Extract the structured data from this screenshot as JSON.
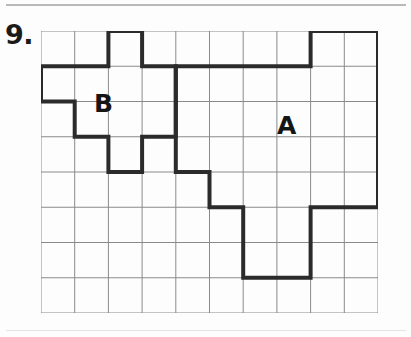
{
  "page": {
    "problem_number": "9.",
    "background_color": "#fdfdfd",
    "width": 411,
    "height": 337
  },
  "grid": {
    "columns": 10,
    "rows": 8,
    "cell_width": 33.7,
    "cell_height": 35.25,
    "origin_x": 41,
    "origin_y": 31,
    "line_color": "#8a8a8a",
    "line_width": 1
  },
  "shapes": [
    {
      "label": "A",
      "stroke_color": "#2b2b2b",
      "stroke_width": 4,
      "label_x": 277,
      "label_y": 113,
      "cells": [
        [
          8,
          0
        ],
        [
          9,
          0
        ],
        [
          5,
          1
        ],
        [
          6,
          1
        ],
        [
          7,
          1
        ],
        [
          8,
          1
        ],
        [
          9,
          1
        ],
        [
          5,
          2
        ],
        [
          6,
          2
        ],
        [
          7,
          2
        ],
        [
          8,
          2
        ],
        [
          9,
          2
        ],
        [
          5,
          3
        ],
        [
          6,
          3
        ],
        [
          7,
          3
        ],
        [
          8,
          3
        ],
        [
          9,
          3
        ],
        [
          5,
          4
        ],
        [
          6,
          4
        ],
        [
          7,
          4
        ],
        [
          8,
          4
        ],
        [
          5,
          5
        ],
        [
          6,
          5
        ],
        [
          7,
          5
        ],
        [
          8,
          5
        ],
        [
          7,
          6
        ],
        [
          8,
          6
        ]
      ],
      "outline_points": [
        [
          8,
          0
        ],
        [
          10,
          0
        ],
        [
          10,
          5
        ],
        [
          8,
          5
        ],
        [
          8,
          7
        ],
        [
          6,
          7
        ],
        [
          6,
          5
        ],
        [
          5,
          5
        ],
        [
          5,
          4
        ],
        [
          4,
          4
        ],
        [
          4,
          1
        ],
        [
          8,
          1
        ]
      ]
    },
    {
      "label": "B",
      "stroke_color": "#2b2b2b",
      "stroke_width": 4,
      "label_x": 94,
      "label_y": 91,
      "cells": [
        [
          2,
          0
        ],
        [
          1,
          1
        ],
        [
          2,
          1
        ],
        [
          3,
          1
        ],
        [
          0,
          2
        ],
        [
          1,
          2
        ],
        [
          2,
          2
        ],
        [
          3,
          2
        ],
        [
          2,
          3
        ]
      ],
      "outline_points": [
        [
          2,
          0
        ],
        [
          3,
          0
        ],
        [
          3,
          1
        ],
        [
          4,
          1
        ],
        [
          4,
          3
        ],
        [
          3,
          3
        ],
        [
          3,
          4
        ],
        [
          2,
          4
        ],
        [
          2,
          3
        ],
        [
          1,
          3
        ],
        [
          1,
          2
        ],
        [
          0,
          2
        ],
        [
          0,
          1
        ],
        [
          2,
          1
        ]
      ]
    }
  ],
  "labels": {
    "shape_a": "A",
    "shape_b": "B"
  }
}
